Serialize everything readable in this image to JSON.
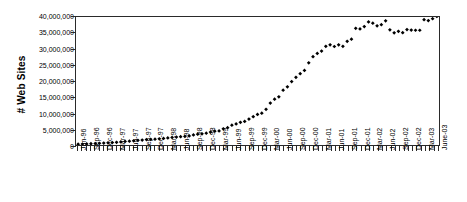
{
  "chart_data": {
    "type": "scatter",
    "title": "",
    "xlabel": "",
    "ylabel": "# Web Sites",
    "ylim": [
      0,
      40000000
    ],
    "ytick_labels": [
      "0",
      "5,000,000",
      "10,000,000",
      "15,000,000",
      "20,000,000",
      "25,000,000",
      "30,000,000",
      "35,000,000",
      "40,000,000"
    ],
    "ytick_values": [
      0,
      5000000,
      10000000,
      15000000,
      20000000,
      25000000,
      30000000,
      35000000,
      40000000
    ],
    "grid": false,
    "legend": "none",
    "marker": "diamond",
    "marker_color": "#000000",
    "xtick_labels": [
      "Jun-96",
      "Sep-96",
      "Dec-96",
      "Mar-97",
      "Jun-97",
      "Sep-97",
      "Dec-97",
      "Mar-98",
      "Jun-98",
      "Sep-98",
      "Dec-98",
      "Mar-99",
      "Jun-99",
      "Sep-99",
      "Dec-99",
      "Mar-00",
      "Jun-00",
      "Sep-00",
      "Dec-00",
      "Mar-01",
      "Jun-01",
      "Sep-01",
      "Dec-01",
      "Mar-02",
      "Jun-02",
      "Sep-02",
      "Dec-02",
      "Mar-03",
      "June-03"
    ],
    "xtick_interval_months": 3,
    "x": [
      "Jun-96",
      "Jul-96",
      "Aug-96",
      "Sep-96",
      "Oct-96",
      "Nov-96",
      "Dec-96",
      "Jan-97",
      "Feb-97",
      "Mar-97",
      "Apr-97",
      "May-97",
      "Jun-97",
      "Jul-97",
      "Aug-97",
      "Sep-97",
      "Oct-97",
      "Nov-97",
      "Dec-97",
      "Jan-98",
      "Feb-98",
      "Mar-98",
      "Apr-98",
      "May-98",
      "Jun-98",
      "Jul-98",
      "Aug-98",
      "Sep-98",
      "Oct-98",
      "Nov-98",
      "Dec-98",
      "Jan-99",
      "Feb-99",
      "Mar-99",
      "Apr-99",
      "May-99",
      "Jun-99",
      "Jul-99",
      "Aug-99",
      "Sep-99",
      "Oct-99",
      "Nov-99",
      "Dec-99",
      "Jan-00",
      "Feb-00",
      "Mar-00",
      "Apr-00",
      "May-00",
      "Jun-00",
      "Jul-00",
      "Aug-00",
      "Sep-00",
      "Oct-00",
      "Nov-00",
      "Dec-00",
      "Jan-01",
      "Feb-01",
      "Mar-01",
      "Apr-01",
      "May-01",
      "Jun-01",
      "Jul-01",
      "Aug-01",
      "Sep-01",
      "Oct-01",
      "Nov-01",
      "Dec-01",
      "Jan-02",
      "Feb-02",
      "Mar-02",
      "Apr-02",
      "May-02",
      "Jun-02",
      "Jul-02",
      "Aug-02",
      "Sep-02",
      "Oct-02",
      "Nov-02",
      "Dec-02",
      "Jan-03",
      "Feb-03",
      "Mar-03",
      "Apr-03",
      "May-03",
      "June-03"
    ],
    "values": [
      252000,
      300000,
      343000,
      397000,
      462000,
      531000,
      603000,
      674000,
      755000,
      833000,
      965000,
      1117000,
      1203000,
      1300000,
      1450000,
      1560000,
      1690000,
      1760000,
      1830000,
      1920000,
      2050000,
      2220000,
      2360000,
      2480000,
      2590000,
      2690000,
      2820000,
      3160000,
      3370000,
      3510000,
      3690000,
      4060000,
      4300000,
      4390000,
      5040000,
      5410000,
      6180000,
      6600000,
      7080000,
      7370000,
      8110000,
      8840000,
      9560000,
      9950000,
      11160000,
      13110000,
      14320000,
      15050000,
      17120000,
      18170000,
      19820000,
      21170000,
      22280000,
      23300000,
      25680000,
      27590000,
      28620000,
      29340000,
      30840000,
      31300000,
      30780000,
      31300000,
      30840000,
      32400000,
      33080000,
      36460000,
      36280000,
      37000000,
      38440000,
      38070000,
      37240000,
      37580000,
      38800000,
      35990000,
      35070000,
      35540000,
      35090000,
      36070000,
      35930000,
      35860000,
      35860000,
      39170000,
      38890000,
      39470000,
      40160000
    ]
  }
}
